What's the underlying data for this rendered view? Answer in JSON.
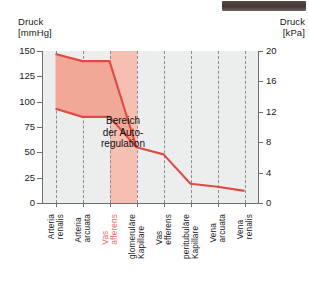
{
  "axes": {
    "left_title": "Druck\n[mmHg]",
    "right_title": "Druck\n[kPa]",
    "left_ticks": [
      "150",
      "125",
      "100",
      "75",
      "50",
      "25",
      "0"
    ],
    "right_ticks": [
      "20",
      "16",
      "12",
      "8",
      "4",
      "0"
    ]
  },
  "annotation": "Bereich\nder Auto-\nregulation",
  "colors": {
    "line": "#e04a42",
    "band_fill": "#f2a896",
    "vas_band": "#f6bfb1",
    "plot_bg": "#eceded",
    "gridline": "#8c8c8c",
    "highlight_label": "#e8705f"
  },
  "chart_data": {
    "type": "line",
    "title": "",
    "xlabel": "",
    "ylabel": "Druck",
    "ylim": [
      0,
      150
    ],
    "ylim_right": [
      0,
      20
    ],
    "y_unit_left": "mmHg",
    "y_unit_right": "kPa",
    "grid": true,
    "legend": "none",
    "categories": [
      "Arteria\nrenalis",
      "Arteria\narcuata",
      "Vas\nafferens",
      "glomeruläre\nKapillare",
      "Vas\nefferens",
      "peritubuläre\nKapillare",
      "Vena\narcuata",
      "Vena\nrenalis"
    ],
    "series": [
      {
        "name": "Druck oben (Autoregulation, oberer Rand)",
        "values": [
          147,
          140,
          140,
          55,
          null,
          null,
          null,
          null
        ]
      },
      {
        "name": "Druck unten (Autoregulation, unterer Rand)",
        "values": [
          93,
          85,
          85,
          55,
          null,
          null,
          null,
          null
        ]
      },
      {
        "name": "Druckverlauf",
        "values": [
          93,
          85,
          85,
          55,
          48,
          19,
          16,
          12
        ]
      }
    ],
    "band": {
      "name": "Bereich der Autoregulation",
      "upper": [
        147,
        140,
        140,
        55
      ],
      "lower": [
        93,
        85,
        85,
        55
      ]
    },
    "shaded_region": {
      "name": "Vas afferens",
      "from_category": "Vas\nafferens",
      "to_category": "glomeruläre\nKapillare"
    }
  }
}
